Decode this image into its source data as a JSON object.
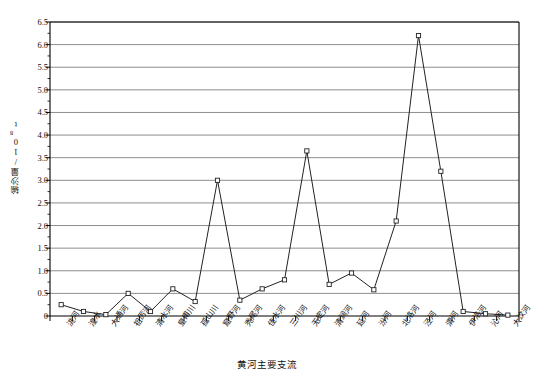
{
  "chart_data": {
    "type": "line",
    "title": "",
    "xlabel": "黄河主要支流",
    "ylabel": "输沙量/10⁸t",
    "ylabel_main": "输沙量/10",
    "ylabel_sup": "8",
    "ylabel_unit": "t",
    "ylim": [
      0,
      6.5
    ],
    "ytick_step": 0.5,
    "grid": true,
    "legend": "none",
    "marker": "open-square",
    "line_color": "#222222",
    "grid_color": "#808080",
    "axis_color": "#000000",
    "yticks": [
      "0",
      "0.5",
      "1.0",
      "1.5",
      "2.0",
      "2.5",
      "3.0",
      "3.5",
      "4.0",
      "4.5",
      "5.0",
      "5.5",
      "6.0",
      "6.5"
    ],
    "ytick_values": [
      0,
      0.5,
      1.0,
      1.5,
      2.0,
      2.5,
      3.0,
      3.5,
      4.0,
      4.5,
      5.0,
      5.5,
      6.0,
      6.5
    ],
    "categories": [
      "洮河",
      "湟水",
      "大通河",
      "祖厉河",
      "清水河",
      "皇甫川",
      "孤山川",
      "窟野河",
      "秃尾河",
      "佳水河",
      "三川河",
      "无定河",
      "清涧河",
      "延河",
      "汾河",
      "北洛河",
      "泾河",
      "渭河",
      "伊洛河",
      "沁河",
      "大汶河"
    ],
    "values": [
      0.25,
      0.1,
      0.03,
      0.5,
      0.1,
      0.6,
      0.32,
      3.0,
      0.35,
      0.6,
      0.8,
      3.65,
      0.7,
      0.95,
      0.58,
      2.1,
      6.2,
      3.2,
      0.1,
      0.05,
      0.02
    ],
    "point_labels": [
      "0.25",
      "0.1",
      "0.03",
      "0.5",
      "0.1",
      "0.6",
      "0.32",
      "3.0",
      "0.35",
      "0.6",
      "0.8",
      "3.65",
      "0.7",
      "0.95",
      "0.58",
      "2.1",
      "6.2",
      "3.2",
      "0.1",
      "0.05",
      "0.02"
    ]
  }
}
